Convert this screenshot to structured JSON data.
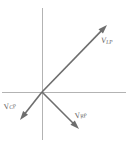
{
  "figure": {
    "name": "phasor-diagram",
    "background_color": "#ffffff",
    "axis_color": "#b3b3b3",
    "phasor_color": "#6e6e6e",
    "label_color": "#5e5e5e",
    "origin": {
      "x": 42,
      "y": 92
    }
  },
  "axes": {
    "horizontal": {
      "x1": 2,
      "y1": 92,
      "x2": 126,
      "y2": 92
    },
    "vertical": {
      "x1": 42,
      "y1": 8,
      "x2": 42,
      "y2": 140
    }
  },
  "chart_data": {
    "type": "scatter",
    "title": "",
    "xlabel": "",
    "ylabel": "",
    "grid": false,
    "legend": "none",
    "origin": {
      "x": 42,
      "y": 92
    },
    "series": [
      {
        "name": "V_LP",
        "label_main": "V",
        "label_sub": "LP",
        "tip": {
          "x": 107,
          "y": 25
        },
        "angle_deg": 45.9,
        "direction": "upper-right"
      },
      {
        "name": "V_CP",
        "label_main": "V",
        "label_sub": "CP",
        "tip": {
          "x": 20,
          "y": 120
        },
        "angle_deg": -128.1,
        "direction": "lower-left"
      },
      {
        "name": "V_RP",
        "label_main": "V",
        "label_sub": "RP",
        "tip": {
          "x": 79,
          "y": 129
        },
        "angle_deg": -45.0,
        "direction": "lower-right"
      }
    ]
  },
  "labels": {
    "vlp": {
      "main": "V",
      "sub": "LP"
    },
    "vcp": {
      "main": "V",
      "sub": "CP"
    },
    "vrp": {
      "main": "V",
      "sub": "RP"
    }
  }
}
